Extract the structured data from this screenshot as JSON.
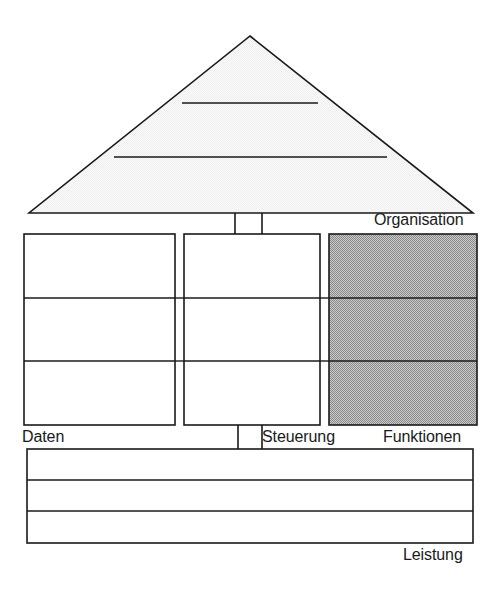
{
  "diagram": {
    "colors": {
      "stroke": "#1a1a1a",
      "roof_fill": "#f2f2f2",
      "box_fill": "#ffffff",
      "highlight_fill": "#a8a8a8",
      "text": "#1a1a1a"
    },
    "roof": {
      "name": "Organisation",
      "label": "Organisation",
      "bands": 3,
      "shape": "triangle"
    },
    "columns": [
      {
        "name": "Daten",
        "label": "Daten",
        "rows": 3,
        "highlighted": false
      },
      {
        "name": "Steuerung",
        "label": "Steuerung",
        "rows": 3,
        "highlighted": false
      },
      {
        "name": "Funktionen",
        "label": "Funktionen",
        "rows": 3,
        "highlighted": true
      }
    ],
    "base": {
      "name": "Leistung",
      "label": "Leistung",
      "rows": 3,
      "highlighted": false
    },
    "labels": {
      "organisation": "Organisation",
      "daten": "Daten",
      "steuerung": "Steuerung",
      "funktionen": "Funktionen",
      "leistung": "Leistung"
    }
  }
}
